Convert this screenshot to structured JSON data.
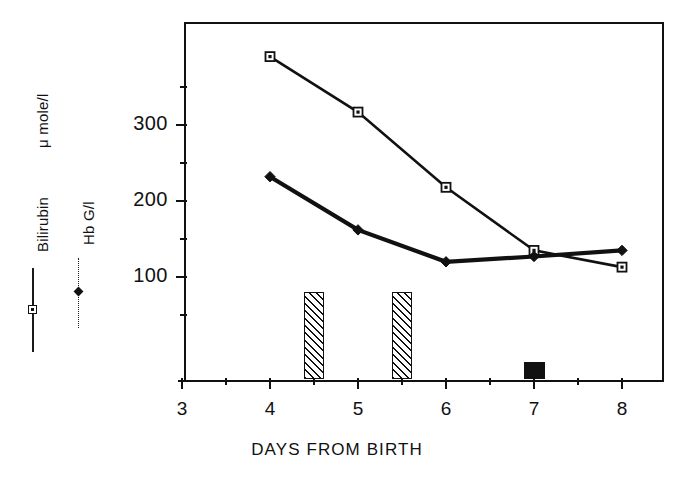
{
  "chart_data": {
    "type": "line",
    "title": "",
    "xlabel": "DAYS FROM BIRTH",
    "ylabel": "",
    "x": [
      4,
      5,
      6,
      7,
      8
    ],
    "xlim": [
      3,
      8
    ],
    "ylim": [
      0,
      400
    ],
    "xticks": [
      "3",
      "4",
      "5",
      "6",
      "7",
      "8"
    ],
    "yticks": [
      "100",
      "200",
      "300"
    ],
    "ytick_values": [
      100,
      200,
      300
    ],
    "yminor_values": [
      50,
      150,
      250,
      350
    ],
    "xminor_values": [
      3.5,
      4.5,
      5.5,
      6.5,
      7.5
    ],
    "grid": false,
    "legend_position": "left-outside",
    "series": [
      {
        "name": "Bilirubin",
        "unit": "μ mole/l",
        "marker": "square",
        "line_style": "solid",
        "x": [
          4,
          5,
          6,
          7,
          8
        ],
        "values": [
          390,
          317,
          218,
          135,
          113
        ]
      },
      {
        "name": "Hb G/l",
        "unit": "G/l",
        "marker": "diamond",
        "line_style": "solid-thick",
        "x": [
          4,
          5,
          6,
          7,
          8
        ],
        "values": [
          232,
          162,
          120,
          127,
          135
        ]
      }
    ],
    "bars": [
      {
        "name": "exchange-transfusion-bar",
        "x": 4.5,
        "height": 115,
        "fill": "hatched"
      },
      {
        "name": "exchange-transfusion-bar",
        "x": 5.5,
        "height": 115,
        "fill": "hatched"
      },
      {
        "name": "transfusion-bar",
        "x": 7.0,
        "height": 22,
        "fill": "solid-black"
      }
    ],
    "annotations": []
  },
  "legend": {
    "entries": [
      {
        "label": "Bilirubin",
        "unit_label": "μ mole/l",
        "marker": "square",
        "line": "solid"
      },
      {
        "label": "Hb G/l",
        "unit_label": "",
        "marker": "diamond",
        "line": "dotted"
      }
    ]
  },
  "axis": {
    "x_title": "DAYS FROM BIRTH"
  }
}
